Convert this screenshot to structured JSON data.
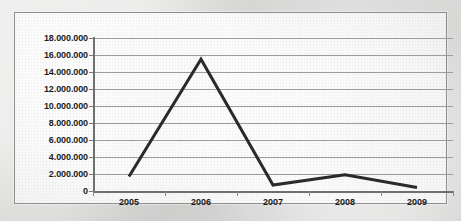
{
  "chart_data": {
    "type": "line",
    "title": "",
    "xlabel": "",
    "ylabel": "",
    "categories": [
      "2005",
      "2006",
      "2007",
      "2008",
      "2009"
    ],
    "series": [
      {
        "name": "",
        "values": [
          1700000,
          15500000,
          700000,
          1900000,
          400000
        ]
      }
    ],
    "ylim": [
      0,
      18000000
    ],
    "ytick_step": 2000000,
    "ytick_labels": [
      "18.000.000",
      "16.000.000",
      "14.000.000",
      "12.000.000",
      "10.000.000",
      "8.000.000",
      "6.000.000",
      "4.000.000",
      "2.000.000",
      "0"
    ],
    "ytick_values": [
      18000000,
      16000000,
      14000000,
      12000000,
      10000000,
      8000000,
      6000000,
      4000000,
      2000000,
      0
    ],
    "grid": true,
    "legend": "none",
    "number_format": "european-dot-thousands",
    "colors": {
      "series_line": "#2a2a2a",
      "gridline": "#9c9c9c",
      "axis": "#6f6f6f",
      "plot_background": "#f1f1f0",
      "frame_border": "#8d8d8d",
      "page_background": "#d9d9d7",
      "label_text": "#1b1b1b"
    }
  }
}
